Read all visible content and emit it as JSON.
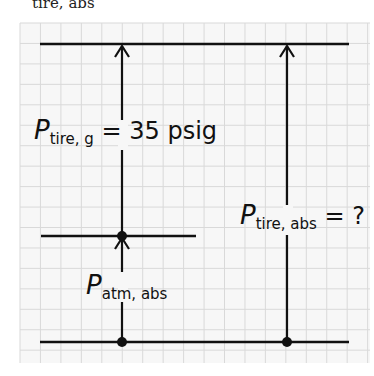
{
  "header_fragment": {
    "subscript": "tire, abs"
  },
  "labels": {
    "gauge": {
      "symbol": "P",
      "subscript": "tire, g",
      "rest": " = 35 psig"
    },
    "tire_abs": {
      "symbol": "P",
      "subscript": "tire, abs",
      "rest": " = ?"
    },
    "atm_abs": {
      "symbol": "P",
      "subscript": "atm, abs",
      "rest": ""
    }
  },
  "colors": {
    "grid": "#d9d9d9",
    "grid_bg": "#f7f7f7",
    "ink": "#111111"
  },
  "diagram": {
    "levels": [
      "absolute zero (bottom line)",
      "atmospheric pressure (middle line)",
      "tire pressure (top line)"
    ],
    "arrows": [
      "P_atm,abs: bottom to middle",
      "P_tire,g: middle to top",
      "P_tire,abs: bottom to top"
    ]
  }
}
